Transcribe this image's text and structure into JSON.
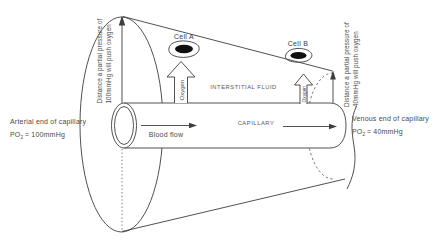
{
  "labels": {
    "left_distance": {
      "line1": "Distance a partial pressure of",
      "line2": "100mmHg will push oxygen"
    },
    "right_distance": {
      "line1": "Distance a partial pressure of",
      "line2": "40mmHg will push oxygen"
    },
    "cell_a": "Cell A",
    "cell_b": "Cell B",
    "oxygen_left": "Oxygen",
    "oxygen_right": "Oxygen",
    "interstitial_fluid": "INTERSTITIAL FLUID",
    "capillary": "CAPILLARY",
    "blood_flow": "Blood flow",
    "arterial": {
      "line1": "Arterial end of capillary",
      "po": "PO",
      "po_sub": "2",
      "po_value": "= 100mmHg"
    },
    "venous": {
      "line1": "Venous end of capillary",
      "po": "PO",
      "po_sub": "2",
      "po_value": "= 40mmHg"
    }
  },
  "colors": {
    "line": "#3d3d3d",
    "text": "#4a4a4a",
    "nucleus": "#101010",
    "background": "#ffffff"
  }
}
